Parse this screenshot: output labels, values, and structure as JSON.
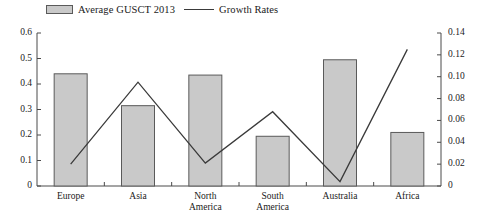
{
  "legend": {
    "items": [
      {
        "label": "Average GUSCT 2013",
        "marker": "bar-swatch",
        "color": "#c9c9c9"
      },
      {
        "label": "Growth Rates",
        "marker": "line-swatch",
        "color": "#3a3a3a"
      }
    ]
  },
  "chart_data": {
    "type": "bar",
    "title": "",
    "xlabel": "",
    "ylabel": "",
    "categories": [
      "Europe",
      "Asia",
      "North\nAmerica",
      "South\nAmerica",
      "Australia",
      "Africa"
    ],
    "grid": false,
    "legend_position": "top-left",
    "series": [
      {
        "name": "Average GUSCT 2013",
        "type": "bar",
        "axis": "left",
        "color": "#c9c9c9",
        "edge_color": "#5a5a5a",
        "values": [
          0.44,
          0.315,
          0.435,
          0.195,
          0.495,
          0.21
        ]
      },
      {
        "name": "Growth Rates",
        "type": "line",
        "axis": "right",
        "color": "#3a3a3a",
        "values": [
          0.02,
          0.095,
          0.021,
          0.068,
          0.004,
          0.125
        ]
      }
    ],
    "left_axis": {
      "min": 0,
      "max": 0.6,
      "step": 0.1,
      "ticks": [
        0,
        0.1,
        0.2,
        0.3,
        0.4,
        0.5,
        0.6
      ],
      "tick_labels": [
        "0",
        "0.1",
        "0.2",
        "0.3",
        "0.4",
        "0.5",
        "0.6"
      ]
    },
    "right_axis": {
      "min": 0,
      "max": 0.14,
      "step": 0.02,
      "ticks": [
        0,
        0.02,
        0.04,
        0.06,
        0.08,
        0.1,
        0.12,
        0.14
      ],
      "tick_labels": [
        "0",
        "0.02",
        "0.04",
        "0.06",
        "0.08",
        "0.10",
        "0.12",
        "0.14"
      ]
    }
  }
}
